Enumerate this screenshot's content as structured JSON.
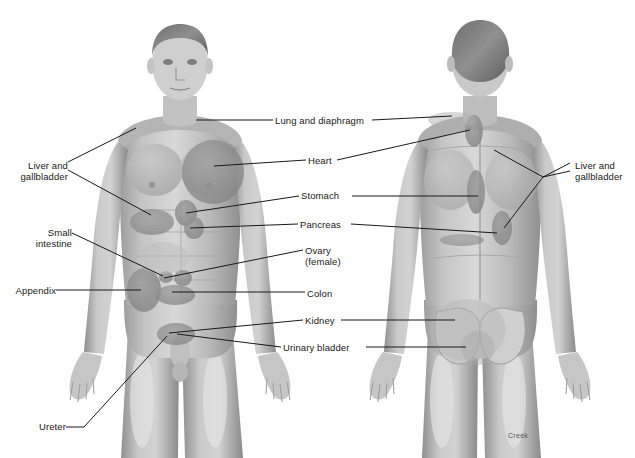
{
  "diagram": {
    "signature": "Creek",
    "background_color": "#ffffff",
    "line_color": "#1a1a1a",
    "text_color": "#1b1b1b",
    "skin_tone": "#b9b9b9",
    "organ_tone": "#8e8e8e"
  },
  "figures": [
    {
      "id": "anterior",
      "view": "front",
      "sex_shown": "male"
    },
    {
      "id": "posterior",
      "view": "back",
      "sex_shown": "male"
    }
  ],
  "labels": [
    {
      "id": "liver-gallbladder-left",
      "text": "Liver and\ngallbladder",
      "side": "left",
      "x": 16,
      "y": 160
    },
    {
      "id": "small-intestine",
      "text": "Small\nintestine",
      "side": "left",
      "x": 31,
      "y": 227
    },
    {
      "id": "appendix",
      "text": "Appendix",
      "side": "left",
      "x": 8,
      "y": 285
    },
    {
      "id": "ureter",
      "text": "Ureter",
      "side": "left",
      "x": 36,
      "y": 421
    },
    {
      "id": "lung-diaphragm",
      "text": "Lung and diaphragm",
      "side": "center",
      "x": 275,
      "y": 115
    },
    {
      "id": "heart",
      "text": "Heart",
      "side": "center",
      "x": 308,
      "y": 155
    },
    {
      "id": "stomach",
      "text": "Stomach",
      "side": "center",
      "x": 301,
      "y": 190
    },
    {
      "id": "pancreas",
      "text": "Pancreas",
      "side": "center",
      "x": 300,
      "y": 219
    },
    {
      "id": "ovary",
      "text": "Ovary\n(female)",
      "side": "center",
      "x": 305,
      "y": 245
    },
    {
      "id": "colon",
      "text": "Colon",
      "side": "center",
      "x": 307,
      "y": 288
    },
    {
      "id": "kidney",
      "text": "Kidney",
      "side": "center",
      "x": 305,
      "y": 315
    },
    {
      "id": "urinary-bladder",
      "text": "Urinary bladder",
      "side": "center",
      "x": 283,
      "y": 342
    },
    {
      "id": "liver-gallbladder-right",
      "text": "Liver and\ngallbladder",
      "side": "right",
      "x": 575,
      "y": 160
    }
  ],
  "leader_lines": [
    {
      "label": "liver-gallbladder-left",
      "points": "68,162 136,128"
    },
    {
      "label": "liver-gallbladder-left",
      "points": "68,170 151,215"
    },
    {
      "label": "small-intestine",
      "points": "72,233 163,276"
    },
    {
      "label": "appendix",
      "points": "56,290 141,290"
    },
    {
      "label": "ureter",
      "points": "66,427 84,427 167,336"
    },
    {
      "label": "lung-diaphragm",
      "points": "273,120 196,120"
    },
    {
      "label": "lung-diaphragm",
      "points": "372,120 452,116"
    },
    {
      "label": "heart",
      "points": "306,160 214,166"
    },
    {
      "label": "heart",
      "points": "337,160 470,130"
    },
    {
      "label": "stomach",
      "points": "299,196 186,213"
    },
    {
      "label": "stomach",
      "points": "352,196 478,196"
    },
    {
      "label": "pancreas",
      "points": "298,224 190,228"
    },
    {
      "label": "pancreas",
      "points": "351,224 497,233"
    },
    {
      "label": "ovary",
      "points": "303,250 164,278"
    },
    {
      "label": "colon",
      "points": "305,292 172,292"
    },
    {
      "label": "kidney",
      "points": "303,320 169,333"
    },
    {
      "label": "kidney",
      "points": "341,320 455,320"
    },
    {
      "label": "urinary-bladder",
      "points": "281,347 177,334"
    },
    {
      "label": "urinary-bladder",
      "points": "366,347 466,347"
    },
    {
      "label": "liver-gallbladder-right",
      "points": "570,163 543,177 494,150"
    },
    {
      "label": "liver-gallbladder-right",
      "points": "570,171 543,177 504,228"
    }
  ],
  "referred_pain_regions": [
    {
      "organ": "heart",
      "figure": "anterior",
      "shape": "ellipse",
      "cx": 213,
      "cy": 172,
      "rx": 31,
      "ry": 32
    },
    {
      "organ": "liver",
      "figure": "anterior",
      "shape": "ellipse",
      "cx": 152,
      "cy": 222,
      "rx": 22,
      "ry": 13
    },
    {
      "organ": "stomach",
      "figure": "anterior",
      "shape": "ellipse",
      "cx": 186,
      "cy": 213,
      "rx": 11,
      "ry": 13
    },
    {
      "organ": "pancreas",
      "figure": "anterior",
      "shape": "ellipse",
      "cx": 194,
      "cy": 228,
      "rx": 10,
      "ry": 11
    },
    {
      "organ": "appendix",
      "figure": "anterior",
      "shape": "ellipse",
      "cx": 144,
      "cy": 290,
      "rx": 17,
      "ry": 22
    },
    {
      "organ": "small-intestine",
      "figure": "anterior",
      "shape": "ellipse",
      "cx": 166,
      "cy": 277,
      "rx": 7,
      "ry": 6
    },
    {
      "organ": "ovary",
      "figure": "anterior",
      "shape": "ellipse",
      "cx": 183,
      "cy": 278,
      "rx": 9,
      "ry": 8
    },
    {
      "organ": "colon",
      "figure": "anterior",
      "shape": "ellipse",
      "cx": 175,
      "cy": 295,
      "rx": 20,
      "ry": 10
    },
    {
      "organ": "bladder",
      "figure": "anterior",
      "shape": "ellipse",
      "cx": 176,
      "cy": 334,
      "rx": 19,
      "ry": 11
    },
    {
      "organ": "lung-diaphragm",
      "figure": "posterior",
      "shape": "ellipse",
      "cx": 474,
      "cy": 131,
      "rx": 9,
      "ry": 16
    },
    {
      "organ": "stomach",
      "figure": "posterior",
      "shape": "ellipse",
      "cx": 476,
      "cy": 192,
      "rx": 9,
      "ry": 22
    },
    {
      "organ": "liver",
      "figure": "posterior",
      "shape": "ellipse",
      "cx": 502,
      "cy": 228,
      "rx": 10,
      "ry": 17
    },
    {
      "organ": "pancreas",
      "figure": "posterior",
      "shape": "ellipse",
      "cx": 462,
      "cy": 240,
      "rx": 22,
      "ry": 6
    },
    {
      "organ": "kidney",
      "figure": "posterior",
      "shape": "ellipse",
      "cx": 468,
      "cy": 330,
      "rx": 38,
      "ry": 31
    },
    {
      "organ": "bladder",
      "figure": "posterior",
      "shape": "ellipse",
      "cx": 478,
      "cy": 348,
      "rx": 17,
      "ry": 17
    }
  ]
}
